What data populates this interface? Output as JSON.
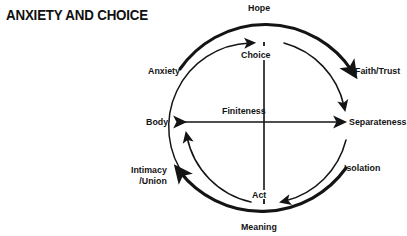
{
  "page": {
    "title": "ANXIETY AND CHOICE",
    "background_color": "#ffffff",
    "ink_color": "#141414",
    "width": 407,
    "height": 236
  },
  "diagram": {
    "type": "cycle-diagram",
    "shape": "circle",
    "center": {
      "x": 268,
      "y": 122
    },
    "outer_radius": 104,
    "inner_radius": 84,
    "nodes": [
      {
        "id": "hope",
        "label": "Hope",
        "position": "top",
        "ring": "outer"
      },
      {
        "id": "choice",
        "label": "Choice",
        "position": "top-inner",
        "ring": "inner"
      },
      {
        "id": "anxiety",
        "label": "Anxiety",
        "position": "upper-left",
        "ring": "outer"
      },
      {
        "id": "faith-trust",
        "label": "Faith/Trust",
        "position": "upper-right",
        "ring": "outer"
      },
      {
        "id": "finiteness",
        "label": "Finiteness",
        "position": "center",
        "ring": "axis"
      },
      {
        "id": "body",
        "label": "Body",
        "position": "left",
        "ring": "axis"
      },
      {
        "id": "separateness",
        "label": "Separateness",
        "position": "right",
        "ring": "axis"
      },
      {
        "id": "isolation",
        "label": "Isolation",
        "position": "lower-right",
        "ring": "inner"
      },
      {
        "id": "intimacy-union",
        "label": "Intimacy\n/Union",
        "label_line1": "Intimacy",
        "label_line2": "/Union",
        "position": "lower-left",
        "ring": "outer"
      },
      {
        "id": "act",
        "label": "Act",
        "position": "bottom-inner",
        "ring": "inner"
      },
      {
        "id": "meaning",
        "label": "Meaning",
        "position": "bottom",
        "ring": "outer"
      }
    ],
    "arrows": [
      {
        "id": "arc-anxiety-hope-faith",
        "from": "anxiety",
        "through": "hope",
        "to": "faith-trust",
        "style": "thick-arc",
        "arrowhead": "end"
      },
      {
        "id": "arc-choice-separateness",
        "from": "choice",
        "to": "separateness",
        "style": "thin-arc",
        "arrowhead": "end"
      },
      {
        "id": "arc-to-choice",
        "from": "body-lower",
        "to": "choice",
        "style": "thin-arc",
        "arrowhead": "end"
      },
      {
        "id": "axis-body-separateness",
        "from": "body",
        "to": "separateness",
        "style": "double-arrow",
        "arrowhead": "both",
        "label": "Finiteness"
      },
      {
        "id": "axis-choice-act",
        "from": "choice",
        "to": "act",
        "style": "line",
        "arrowhead": "none"
      },
      {
        "id": "arc-isolation-act",
        "from": "isolation",
        "to": "act",
        "style": "thin-arc",
        "arrowhead": "end"
      },
      {
        "id": "arc-act-body",
        "from": "act",
        "to": "body",
        "style": "thin-arc",
        "arrowhead": "end"
      },
      {
        "id": "arc-meaning-intimacy",
        "from": "meaning",
        "to": "intimacy-union",
        "style": "thick-arc",
        "arrowhead": "end"
      }
    ]
  }
}
